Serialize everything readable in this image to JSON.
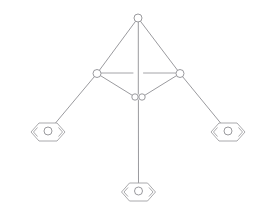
{
  "figure": {
    "type": "mechanism-schematic",
    "canvas": {
      "width": 267,
      "height": 209,
      "background": "#ffffff"
    },
    "stroke_color": "#8e8e93",
    "support_stroke_color": "#a0a0a4",
    "line_width": 0.9
  },
  "joints": [
    {
      "id": "apex",
      "label": "apex-joint",
      "x": 138.0,
      "y": 18.0,
      "r": 4.0
    },
    {
      "id": "left-knee",
      "label": "left-knee-joint",
      "x": 97.0,
      "y": 73.5,
      "r": 4.0
    },
    {
      "id": "right-knee",
      "label": "right-knee-joint",
      "x": 180.0,
      "y": 73.5,
      "r": 4.0
    },
    {
      "id": "center-left",
      "label": "center-left-joint",
      "x": 135.0,
      "y": 97.0,
      "r": 3.2
    },
    {
      "id": "center-right",
      "label": "center-right-joint",
      "x": 142.0,
      "y": 97.0,
      "r": 3.2
    }
  ],
  "supports": [
    {
      "id": "left-support",
      "label": "left-pin-support",
      "x": 48.0,
      "y": 132.0,
      "r": 4.0,
      "half_width": 17.0,
      "half_height": 9.0
    },
    {
      "id": "right-support",
      "label": "right-pin-support",
      "x": 228.0,
      "y": 132.0,
      "r": 4.0,
      "half_width": 17.0,
      "half_height": 9.0
    },
    {
      "id": "bottom-support",
      "label": "bottom-pin-support",
      "x": 138.5,
      "y": 192.0,
      "r": 4.0,
      "half_width": 17.0,
      "half_height": 9.0
    }
  ],
  "members": [
    {
      "id": "apex-to-left-knee",
      "label": "upper-left-member",
      "x1": 138.0,
      "y1": 18.0,
      "x2": 97.0,
      "y2": 73.5
    },
    {
      "id": "apex-to-right-knee",
      "label": "upper-right-member",
      "x1": 138.0,
      "y1": 18.0,
      "x2": 180.0,
      "y2": 73.5
    },
    {
      "id": "left-knee-to-center",
      "label": "lower-left-member",
      "x1": 97.0,
      "y1": 73.5,
      "x2": 135.0,
      "y2": 97.0
    },
    {
      "id": "right-knee-to-center",
      "label": "lower-right-member",
      "x1": 180.0,
      "y1": 73.5,
      "x2": 142.0,
      "y2": 97.0
    },
    {
      "id": "left-knee-to-support",
      "label": "left-leg-member",
      "x1": 97.0,
      "y1": 73.5,
      "x2": 48.0,
      "y2": 132.0
    },
    {
      "id": "right-knee-to-support",
      "label": "right-leg-member",
      "x1": 180.0,
      "y1": 73.5,
      "x2": 228.0,
      "y2": 132.0
    },
    {
      "id": "apex-to-center-vertical",
      "label": "upper-vertical-member",
      "x1": 138.3,
      "y1": 18.0,
      "x2": 138.3,
      "y2": 94.0
    },
    {
      "id": "center-to-bottom-vertical",
      "label": "lower-vertical-member",
      "x1": 138.4,
      "y1": 100.0,
      "x2": 138.5,
      "y2": 192.0
    }
  ],
  "tick_lines": [
    {
      "id": "left-tick",
      "label": "left-horizontal-tick",
      "x1": 101.5,
      "y1": 73.0,
      "x2": 133.0,
      "y2": 73.0
    },
    {
      "id": "right-tick",
      "label": "right-horizontal-tick",
      "x1": 143.5,
      "y1": 73.0,
      "x2": 175.5,
      "y2": 73.0
    }
  ]
}
